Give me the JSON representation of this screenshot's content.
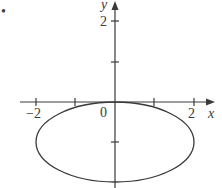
{
  "figure": {
    "bullet": "•",
    "axes": {
      "x_label": "x",
      "y_label": "y",
      "origin_label": "0",
      "x_tick_labels": {
        "neg2": "−2",
        "pos2": "2"
      },
      "y_tick_labels": {
        "pos2": "2"
      }
    },
    "curve": {
      "type": "ellipse",
      "center": [
        0,
        -1
      ],
      "semi_axis_x": 2,
      "semi_axis_y": 1,
      "equation": "x^2/4 + (y+1)^2 = 1"
    },
    "colors": {
      "stroke": "#3a3a3a",
      "background": "#ffffff"
    }
  }
}
